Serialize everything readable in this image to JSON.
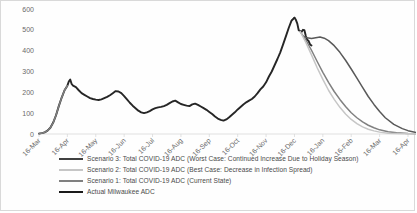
{
  "chart_data": {
    "type": "line",
    "title": "",
    "xlabel": "",
    "ylabel": "",
    "ylim": [
      0,
      600
    ],
    "ytick_step": 100,
    "grid": false,
    "legend_position": "bottom",
    "yticks": [
      "0",
      "100",
      "200",
      "300",
      "400",
      "500",
      "600"
    ],
    "categories": [
      "16-Mar",
      "16-Apr",
      "16-May",
      "16-Jun",
      "16-Jul",
      "16-Aug",
      "16-Sep",
      "16-Oct",
      "16-Nov",
      "16-Dec",
      "16-Jan",
      "16-Feb",
      "16-Mar",
      "16-Apr"
    ],
    "series": [
      {
        "name": "Actual Milwaukee ADC",
        "color": "#262626",
        "width": 1.9,
        "x": [
          0.0,
          0.1,
          0.2,
          0.3,
          0.4,
          0.5,
          0.6,
          0.7,
          0.8,
          0.9,
          1.0,
          1.05,
          1.1,
          1.15,
          1.2,
          1.3,
          1.4,
          1.5,
          1.6,
          1.7,
          1.8,
          1.9,
          2.0,
          2.1,
          2.2,
          2.3,
          2.4,
          2.5,
          2.6,
          2.7,
          2.8,
          2.9,
          3.0,
          3.1,
          3.2,
          3.3,
          3.4,
          3.5,
          3.6,
          3.7,
          3.8,
          3.9,
          4.0,
          4.1,
          4.2,
          4.3,
          4.4,
          4.5,
          4.6,
          4.7,
          4.8,
          4.9,
          5.0,
          5.1,
          5.2,
          5.3,
          5.4,
          5.5,
          5.6,
          5.7,
          5.8,
          5.9,
          6.0,
          6.1,
          6.2,
          6.3,
          6.4,
          6.5,
          6.6,
          6.7,
          6.8,
          6.9,
          7.0,
          7.1,
          7.2,
          7.3,
          7.4,
          7.5,
          7.6,
          7.7,
          7.8,
          7.9,
          8.0,
          8.1,
          8.2,
          8.3,
          8.4,
          8.5,
          8.6,
          8.7,
          8.8,
          8.9,
          9.0
        ],
        "values": [
          2,
          4,
          8,
          16,
          30,
          55,
          90,
          135,
          175,
          210,
          232,
          252,
          262,
          240,
          232,
          225,
          210,
          196,
          188,
          180,
          172,
          168,
          165,
          163,
          166,
          172,
          178,
          186,
          196,
          206,
          204,
          196,
          182,
          166,
          150,
          136,
          124,
          112,
          104,
          100,
          104,
          110,
          118,
          124,
          128,
          130,
          134,
          140,
          148,
          156,
          160,
          152,
          144,
          140,
          136,
          134,
          142,
          146,
          140,
          132,
          124,
          116,
          106,
          96,
          84,
          74,
          68,
          64,
          70,
          80,
          92,
          104,
          118,
          130,
          142,
          152,
          160,
          168,
          180,
          196,
          214,
          228,
          248,
          276,
          300,
          330,
          360,
          392,
          430,
          470,
          510,
          545,
          558
        ]
      },
      {
        "name": "Actual Milwaukee ADC (late)",
        "color": "#262626",
        "width": 1.9,
        "x": [
          9.0,
          9.05,
          9.1,
          9.15,
          9.2,
          9.25,
          9.3,
          9.35,
          9.4,
          9.45,
          9.5,
          9.55,
          9.6
        ],
        "values": [
          558,
          548,
          530,
          498,
          494,
          490,
          500,
          498,
          470,
          452,
          446,
          430,
          425
        ]
      },
      {
        "name": "Scenario 3: Total COVID-19 ADC (Worst Case: Continued Increase Due to Holiday Season)",
        "color": "#595959",
        "width": 1.5,
        "x": [
          9.3,
          9.45,
          9.6,
          9.75,
          9.9,
          10.05,
          10.2,
          10.4,
          10.6,
          10.8,
          11.0,
          11.2,
          11.4,
          11.6,
          11.8,
          12.0,
          12.2,
          12.5,
          12.8,
          13.0,
          13.3,
          13.6,
          14.0
        ],
        "values": [
          470,
          462,
          458,
          462,
          466,
          460,
          448,
          424,
          392,
          354,
          312,
          268,
          224,
          180,
          142,
          108,
          78,
          46,
          26,
          16,
          7,
          3,
          1
        ]
      },
      {
        "name": "Scenario 1: Total COVID-19 ADC (Current State)",
        "color": "#808080",
        "width": 1.5,
        "x": [
          9.2,
          9.4,
          9.6,
          9.8,
          10.0,
          10.2,
          10.4,
          10.6,
          10.8,
          11.0,
          11.2,
          11.4,
          11.6,
          11.8,
          12.0,
          12.3,
          12.6,
          13.0,
          13.4,
          14.0
        ],
        "values": [
          492,
          452,
          402,
          348,
          296,
          248,
          204,
          166,
          132,
          102,
          78,
          58,
          42,
          30,
          20,
          11,
          6,
          2,
          1,
          0
        ]
      },
      {
        "name": "Scenario 2: Total COVID-19 ADC (Best Case: Decrease in Infection Spread)",
        "color": "#c6c6c6",
        "width": 1.5,
        "x": [
          9.2,
          9.4,
          9.6,
          9.8,
          10.0,
          10.2,
          10.4,
          10.6,
          10.8,
          11.0,
          11.2,
          11.4,
          11.6,
          11.8,
          12.0,
          12.3,
          12.6,
          13.0,
          14.0
        ],
        "values": [
          492,
          440,
          380,
          318,
          262,
          210,
          166,
          128,
          96,
          70,
          50,
          34,
          23,
          15,
          9,
          4,
          2,
          1,
          0
        ]
      },
      {
        "name": "Baseline ramp",
        "color": "#808080",
        "width": 1.5,
        "x": [
          0.0,
          0.1,
          0.2,
          0.3,
          0.4,
          0.5,
          0.6,
          0.7,
          0.8,
          0.9,
          1.0
        ],
        "values": [
          2,
          4,
          8,
          16,
          30,
          55,
          90,
          135,
          175,
          210,
          232
        ]
      }
    ],
    "legend": [
      {
        "label": "Scenario 3: Total COVID-19 ADC (Worst Case: Continued Increase Due to Holiday Season)",
        "color": "#404040",
        "width": 2.2
      },
      {
        "label": "Scenario 2: Total COVID-19 ADC (Best Case: Decrease in Infection Spread)",
        "color": "#c6c6c6",
        "width": 2.2
      },
      {
        "label": "Scenario 1: Total COVID-19 ADC (Current State)",
        "color": "#808080",
        "width": 2.2
      },
      {
        "label": "Actual Milwaukee ADC",
        "color": "#1a1a1a",
        "width": 2.6
      }
    ]
  }
}
